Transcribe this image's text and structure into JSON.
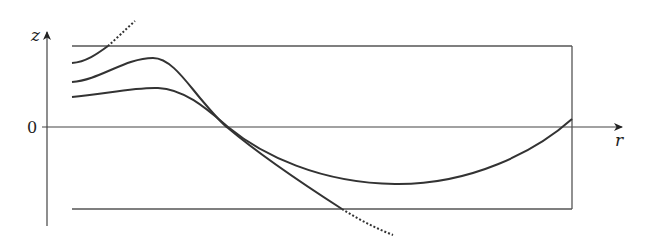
{
  "figure": {
    "type": "diagram",
    "axes": {
      "vertical_label": "z",
      "horizontal_label": "r",
      "origin_label": "0"
    },
    "colors": {
      "ink": "#333333",
      "background": "#ffffff"
    },
    "elements": {
      "top_boundary": "horizontal line (upper plate)",
      "bottom_boundary": "horizontal line (lower plate)",
      "right_wall": "vertical line at right",
      "curves": [
        {
          "name": "upper-curve",
          "style": "solid then dotted",
          "note": "rises and exits through top plate (dotted continuation)"
        },
        {
          "name": "middle-curve",
          "style": "solid then dotted",
          "note": "peaks, crosses z=0, exits through bottom plate (dotted continuation)"
        },
        {
          "name": "lower-curve",
          "style": "solid",
          "note": "gentle peak, crosses z=0, minimum below axis, meets right wall above z=0"
        }
      ]
    }
  }
}
